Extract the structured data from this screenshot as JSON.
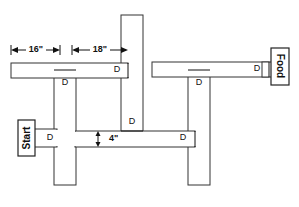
{
  "figure": {
    "background_color": "#ffffff",
    "line_color": "#333333",
    "text_color": "#111111"
  },
  "endpoints": {
    "start": {
      "label": "Start",
      "orientation": "rotated-90-ccw"
    },
    "food": {
      "label": "Food",
      "orientation": "rotated-90-cw"
    }
  },
  "dimensions": [
    {
      "id": "dim-16",
      "label": "16\"",
      "orientation": "horizontal"
    },
    {
      "id": "dim-18",
      "label": "18\"",
      "orientation": "horizontal"
    },
    {
      "id": "dim-4",
      "label": "4\"",
      "orientation": "vertical"
    }
  ],
  "doors": [
    {
      "id": "door-top-left-corridor",
      "label": "D"
    },
    {
      "id": "door-left-vertical-upper",
      "label": "D"
    },
    {
      "id": "door-top-right-corridor",
      "label": "D"
    },
    {
      "id": "door-right-vertical-upper",
      "label": "D"
    },
    {
      "id": "door-center-vertical-low",
      "label": "D"
    },
    {
      "id": "door-start-corridor",
      "label": "D"
    },
    {
      "id": "door-lower-corridor",
      "label": "D"
    }
  ],
  "corridors": [
    {
      "id": "corridor-top-left",
      "orientation": "horizontal"
    },
    {
      "id": "corridor-top-right",
      "orientation": "horizontal"
    },
    {
      "id": "corridor-lower-middle",
      "orientation": "horizontal"
    },
    {
      "id": "corridor-center-vertical",
      "orientation": "vertical"
    },
    {
      "id": "corridor-left-vertical",
      "orientation": "vertical"
    },
    {
      "id": "corridor-right-vertical",
      "orientation": "vertical"
    }
  ]
}
